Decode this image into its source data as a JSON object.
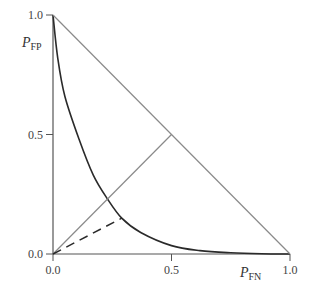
{
  "chart_data": {
    "type": "line",
    "title": "",
    "xlabel": "P",
    "xlabel_sub": "FN",
    "ylabel": "P",
    "ylabel_sub": "FP",
    "xlim": [
      0,
      1
    ],
    "ylim": [
      0,
      1
    ],
    "x_ticks": [
      "0.0",
      "0.5",
      "1.0"
    ],
    "y_ticks": [
      "0.0",
      "0.5",
      "1.0"
    ],
    "grid": false,
    "legend": null,
    "series": [
      {
        "name": "error-tradeoff-curve",
        "style": "solid-dark",
        "x": [
          0.0,
          0.02,
          0.05,
          0.11,
          0.17,
          0.23,
          0.29,
          0.37,
          0.5,
          0.62,
          0.75,
          0.88,
          1.0
        ],
        "y": [
          1.0,
          0.82,
          0.66,
          0.48,
          0.33,
          0.23,
          0.15,
          0.09,
          0.035,
          0.014,
          0.005,
          0.001,
          0.0
        ]
      },
      {
        "name": "chance-line",
        "style": "solid-gray",
        "x": [
          0.0,
          1.0
        ],
        "y": [
          1.0,
          0.0
        ]
      },
      {
        "name": "equal-error-diagonal",
        "style": "solid-gray",
        "x": [
          0.0,
          0.5
        ],
        "y": [
          0.0,
          0.5
        ]
      },
      {
        "name": "dashed-segment",
        "style": "dashed-dark",
        "x": [
          0.0,
          0.29
        ],
        "y": [
          0.0,
          0.15
        ]
      }
    ]
  },
  "layout": {
    "origin_px": [
      53,
      254
    ],
    "x_end_px": 290,
    "y_end_px": 15,
    "colors": {
      "curve": "#2a2a2a",
      "gray_line": "#8a8a8a",
      "axis": "#555555"
    }
  }
}
